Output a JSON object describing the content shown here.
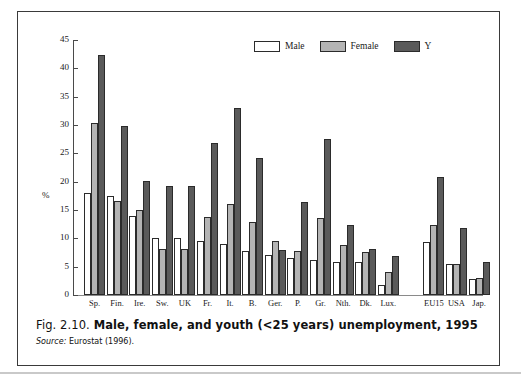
{
  "figure": {
    "caption_number": "Fig. 2.10.",
    "caption_text": "Male, female, and youth (<25 years) unemployment, 1995",
    "source_word": "Source:",
    "source_text": "Eurostat (1996)."
  },
  "legend": {
    "position": "top-right",
    "items": [
      {
        "label": "Male",
        "color": "#ffffff"
      },
      {
        "label": "Female",
        "color": "#b4b4b4"
      },
      {
        "label": "Y",
        "color": "#5a5a5a"
      }
    ]
  },
  "chart_data": {
    "type": "bar",
    "title": "Male, female, and youth (<25 years) unemployment, 1995",
    "xlabel": "",
    "ylabel": "%",
    "ylim": [
      0,
      45
    ],
    "yticks": [
      0,
      5,
      10,
      15,
      20,
      25,
      30,
      35,
      40,
      45
    ],
    "grid": false,
    "legend_position": "top-right",
    "categories": [
      "Sp.",
      "Fin.",
      "Ire.",
      "Sw.",
      "UK",
      "Fr.",
      "It.",
      "B.",
      "Ger.",
      "P.",
      "Gr.",
      "Nth.",
      "Dk.",
      "Lux.",
      "EU15",
      "USA",
      "Jap."
    ],
    "series": [
      {
        "name": "Male",
        "color": "#ffffff",
        "values": [
          18.0,
          17.5,
          14.0,
          10.1,
          10.0,
          9.5,
          9.0,
          7.7,
          7.1,
          6.5,
          6.1,
          5.8,
          5.8,
          1.8,
          9.3,
          5.4,
          2.9
        ]
      },
      {
        "name": "Female",
        "color": "#b4b4b4",
        "values": [
          30.4,
          16.6,
          15.0,
          8.1,
          8.1,
          13.7,
          16.1,
          12.8,
          9.5,
          7.7,
          13.6,
          8.9,
          7.6,
          4.1,
          12.3,
          5.4,
          3.0
        ]
      },
      {
        "name": "Y",
        "color": "#5a5a5a",
        "values": [
          42.3,
          29.8,
          20.2,
          19.3,
          19.3,
          26.8,
          33.0,
          24.2,
          7.9,
          16.5,
          27.6,
          12.3,
          8.1,
          6.9,
          20.8,
          11.8,
          5.9
        ]
      }
    ],
    "group_gap_after_index": 13
  },
  "colors": {
    "male": "#ffffff",
    "female": "#b4b4b4",
    "youth": "#5a5a5a",
    "axis": "#4a4a4a",
    "frame": "#3a3a3a"
  }
}
